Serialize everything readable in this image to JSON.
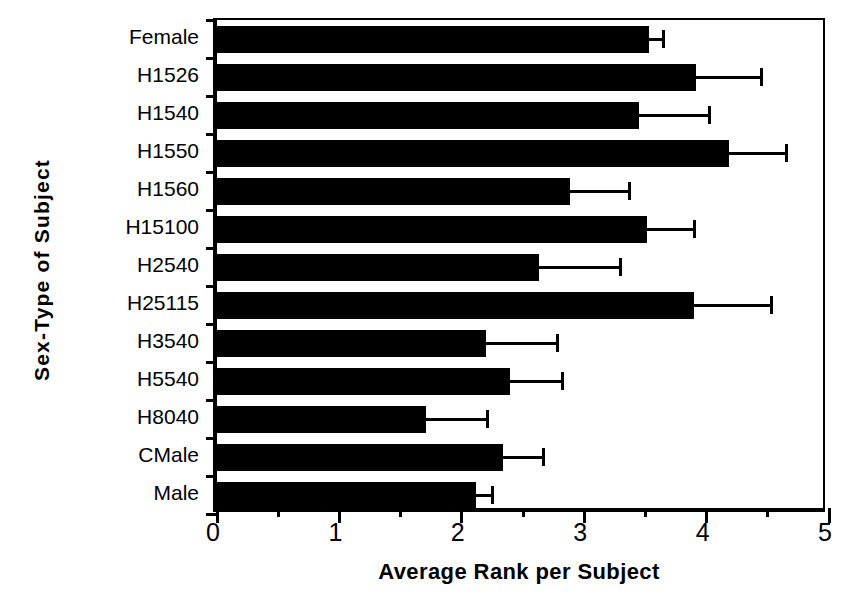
{
  "chart_data": {
    "type": "bar",
    "orientation": "horizontal",
    "title": "",
    "xlabel": "Average Rank  per Subject",
    "ylabel": "Sex-Type of Subject",
    "xlim": [
      0,
      5
    ],
    "xticks": [
      0,
      1,
      2,
      3,
      4,
      5
    ],
    "xtick_labels": [
      "0",
      "1",
      "2",
      "3",
      "4",
      "5"
    ],
    "xminor_ticks": [
      0.5,
      1.5,
      2.5,
      3.5,
      4.5
    ],
    "grid": false,
    "legend": false,
    "bar_color": "#000000",
    "categories": [
      "Female",
      "H1526",
      "H1540",
      "H1550",
      "H1560",
      "H15100",
      "H2540",
      "H25115",
      "H3540",
      "H5540",
      "H8040",
      "CMale",
      "Male"
    ],
    "values": [
      3.53,
      3.91,
      3.45,
      4.18,
      2.88,
      3.51,
      2.63,
      3.9,
      2.2,
      2.39,
      1.71,
      2.34,
      2.12
    ],
    "error_upper": [
      3.65,
      4.45,
      4.02,
      4.65,
      3.37,
      3.9,
      3.3,
      4.53,
      2.78,
      2.82,
      2.21,
      2.67,
      2.25
    ]
  },
  "axis": {
    "x_title": "Average Rank  per Subject",
    "y_title": "Sex-Type of Subject"
  }
}
